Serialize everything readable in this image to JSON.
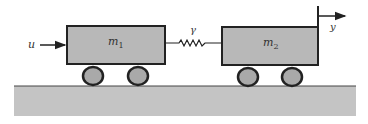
{
  "diagram": {
    "input": {
      "label": "u"
    },
    "output": {
      "label": "y"
    },
    "spring": {
      "label": "γ"
    },
    "carts": [
      {
        "label": "m",
        "subscript": "1"
      },
      {
        "label": "m",
        "subscript": "2"
      }
    ],
    "colors": {
      "cart_fill": "#b8b8b8",
      "ground_fill": "#c4c4c4",
      "stroke": "#222222",
      "wheel_fill": "#a9a9a9"
    }
  }
}
